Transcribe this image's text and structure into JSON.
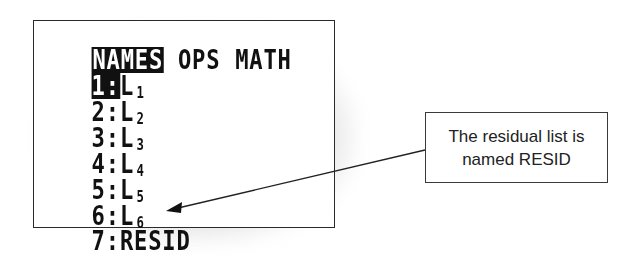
{
  "screen": {
    "tabs": [
      {
        "label": "NAMES",
        "active": true
      },
      {
        "label": "OPS",
        "active": false
      },
      {
        "label": "MATH",
        "active": false
      }
    ],
    "items": [
      {
        "num": "1:",
        "name": "L",
        "sub": "1",
        "selected": true
      },
      {
        "num": "2:",
        "name": "L",
        "sub": "2",
        "selected": false
      },
      {
        "num": "3:",
        "name": "L",
        "sub": "3",
        "selected": false
      },
      {
        "num": "4:",
        "name": "L",
        "sub": "4",
        "selected": false
      },
      {
        "num": "5:",
        "name": "L",
        "sub": "5",
        "selected": false
      },
      {
        "num": "6:",
        "name": "L",
        "sub": "6",
        "selected": false
      },
      {
        "num": "7:",
        "name": "RESID",
        "sub": "",
        "selected": false
      }
    ]
  },
  "callout": {
    "line1": "The residual list is",
    "line2": "named RESID"
  },
  "colors": {
    "screen_text": "#111111",
    "highlight_bg": "#111111",
    "highlight_text": "#ffffff",
    "callout_border": "#3a3a3a"
  }
}
